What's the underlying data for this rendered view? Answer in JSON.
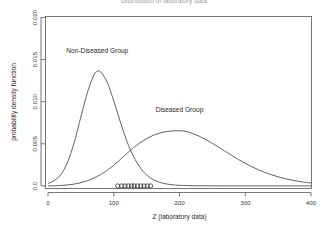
{
  "figure": {
    "title_clipped": "Distribution of laboratory data",
    "title_visible": false
  },
  "chart_data": {
    "type": "line",
    "title": "",
    "xlabel": "Z (laboratory data)",
    "ylabel": "probability density function",
    "xlim": [
      0,
      400
    ],
    "ylim": [
      0,
      0.02
    ],
    "grid": false,
    "legend_position": "inline-annotations",
    "xticks": [
      0,
      100,
      200,
      300,
      400
    ],
    "xtick_labels": [
      "0",
      "100",
      "200",
      "300",
      "400"
    ],
    "yticks": [
      0.0,
      0.005,
      0.01,
      0.015,
      0.02
    ],
    "ytick_labels": [
      "0.0",
      "0.005",
      "0.010",
      "0.015",
      "0.020"
    ],
    "annotations": [
      {
        "name": "non-diseased-label",
        "text": "Non-Diseased Group",
        "x": 75,
        "y": 0.0158
      },
      {
        "name": "diseased-label",
        "text": "Diseased Group",
        "x": 200,
        "y": 0.0088
      }
    ],
    "series": [
      {
        "name": "Non-Diseased Group",
        "distribution": "lognormal-like",
        "peak_x": 75,
        "peak_y": 0.0136,
        "mode": 75,
        "x": [
          0,
          10,
          20,
          30,
          40,
          50,
          60,
          70,
          75,
          80,
          90,
          100,
          110,
          120,
          130,
          140,
          150,
          160,
          170,
          180,
          190,
          200,
          220,
          240,
          260,
          280,
          300,
          320,
          340,
          360,
          380,
          400
        ],
        "values": [
          0.0003,
          0.00065,
          0.0014,
          0.00285,
          0.0052,
          0.0082,
          0.0111,
          0.0132,
          0.0136,
          0.01355,
          0.0123,
          0.0101,
          0.0076,
          0.0053,
          0.0035,
          0.0022,
          0.0013,
          0.00075,
          0.00042,
          0.00023,
          0.00013,
          7e-05,
          2e-05,
          1e-05,
          4e-06,
          2e-06,
          1e-06,
          5e-07,
          2e-07,
          1e-07,
          5e-08,
          2e-08
        ]
      },
      {
        "name": "Diseased Group",
        "distribution": "lognormal-like",
        "peak_x": 197,
        "peak_y": 0.00655,
        "mode": 197,
        "x": [
          0,
          20,
          40,
          60,
          80,
          100,
          120,
          140,
          160,
          180,
          197,
          210,
          230,
          250,
          270,
          290,
          310,
          330,
          350,
          370,
          390,
          400
        ],
        "values": [
          0.0,
          5e-05,
          0.00022,
          0.00062,
          0.00135,
          0.00245,
          0.00385,
          0.00512,
          0.006,
          0.00645,
          0.00655,
          0.00645,
          0.0059,
          0.00505,
          0.00408,
          0.00312,
          0.00228,
          0.0016,
          0.00108,
          0.0007,
          0.00044,
          0.00035
        ]
      }
    ],
    "rug": {
      "name": "observed-data-points",
      "marker": "open-circle",
      "y": 0.0,
      "x": [
        106,
        112,
        117,
        122,
        127,
        131,
        136,
        141,
        146,
        151,
        156
      ]
    }
  }
}
